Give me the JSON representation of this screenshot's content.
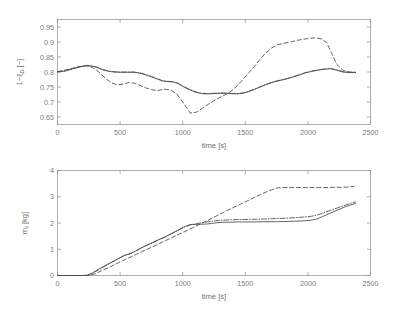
{
  "figure": {
    "background_color": "#ffffff",
    "line_color": "#4a4a4a",
    "axis_color": "#8c8c8c",
    "text_color": "#7a7a7a"
  },
  "chart_data": [
    {
      "type": "line",
      "panel": "top",
      "title": "",
      "xlabel": "time [s]",
      "ylabel": "1-ξ_D [-]",
      "ylabel_display": "1−ξ",
      "ylabel_sub": "D",
      "ylabel_unit": " [−]",
      "xlim": [
        0,
        2500
      ],
      "ylim": [
        0.625,
        0.975
      ],
      "xticks": [
        0,
        500,
        1000,
        1500,
        2000,
        2500
      ],
      "xtick_labels": [
        "0",
        "500",
        "1000",
        "1500",
        "2000",
        "2500"
      ],
      "yticks": [
        0.65,
        0.7,
        0.75,
        0.8,
        0.85,
        0.9,
        0.95
      ],
      "ytick_labels": [
        "0.65",
        "0.7",
        "0.75",
        "0.8",
        "0.85",
        "0.9",
        "0.95"
      ],
      "grid": false,
      "legend": "none",
      "series": [
        {
          "name": "solid",
          "style": "solid",
          "x": [
            0,
            60,
            120,
            180,
            230,
            270,
            310,
            350,
            400,
            450,
            500,
            560,
            610,
            660,
            700,
            750,
            800,
            840,
            880,
            920,
            960,
            1000,
            1050,
            1100,
            1150,
            1200,
            1250,
            1300,
            1340,
            1380,
            1430,
            1480,
            1530,
            1580,
            1630,
            1680,
            1730,
            1780,
            1830,
            1880,
            1930,
            1980,
            2030,
            2080,
            2130,
            2180,
            2230,
            2280,
            2330,
            2380
          ],
          "y": [
            0.8,
            0.803,
            0.81,
            0.817,
            0.821,
            0.82,
            0.816,
            0.809,
            0.803,
            0.8,
            0.799,
            0.799,
            0.799,
            0.796,
            0.791,
            0.784,
            0.776,
            0.77,
            0.768,
            0.767,
            0.762,
            0.752,
            0.742,
            0.733,
            0.728,
            0.727,
            0.728,
            0.729,
            0.729,
            0.728,
            0.727,
            0.729,
            0.735,
            0.743,
            0.752,
            0.76,
            0.767,
            0.772,
            0.777,
            0.783,
            0.79,
            0.797,
            0.802,
            0.806,
            0.809,
            0.811,
            0.806,
            0.8,
            0.798,
            0.798
          ]
        },
        {
          "name": "dash-dot",
          "style": "dashdot",
          "x": [
            0,
            60,
            120,
            180,
            230,
            270,
            310,
            350,
            400,
            450,
            500,
            560,
            610,
            660,
            700,
            750,
            800,
            840,
            880,
            920,
            960,
            1000,
            1050,
            1100,
            1150,
            1200,
            1250,
            1300,
            1340,
            1380,
            1430,
            1480,
            1530,
            1580,
            1630,
            1680,
            1730,
            1780,
            1830,
            1880,
            1930,
            1980,
            2030,
            2080,
            2130,
            2180,
            2230,
            2280,
            2330,
            2380
          ],
          "y": [
            0.801,
            0.804,
            0.811,
            0.818,
            0.822,
            0.821,
            0.817,
            0.81,
            0.804,
            0.801,
            0.8,
            0.8,
            0.8,
            0.797,
            0.792,
            0.785,
            0.777,
            0.771,
            0.769,
            0.768,
            0.763,
            0.753,
            0.743,
            0.734,
            0.729,
            0.728,
            0.729,
            0.73,
            0.73,
            0.729,
            0.728,
            0.73,
            0.736,
            0.744,
            0.753,
            0.761,
            0.768,
            0.773,
            0.778,
            0.784,
            0.791,
            0.798,
            0.803,
            0.807,
            0.81,
            0.812,
            0.807,
            0.801,
            0.799,
            0.799
          ]
        },
        {
          "name": "dashed",
          "style": "dashed",
          "x": [
            0,
            80,
            160,
            230,
            280,
            330,
            380,
            430,
            480,
            530,
            570,
            610,
            650,
            700,
            750,
            800,
            850,
            900,
            950,
            1000,
            1060,
            1110,
            1160,
            1210,
            1260,
            1310,
            1360,
            1410,
            1460,
            1510,
            1560,
            1610,
            1660,
            1710,
            1760,
            1810,
            1860,
            1910,
            1960,
            2010,
            2060,
            2110,
            2150,
            2190,
            2230,
            2280,
            2330,
            2380
          ],
          "y": [
            0.801,
            0.808,
            0.817,
            0.821,
            0.815,
            0.8,
            0.78,
            0.764,
            0.757,
            0.76,
            0.765,
            0.763,
            0.757,
            0.748,
            0.741,
            0.738,
            0.743,
            0.74,
            0.728,
            0.7,
            0.663,
            0.666,
            0.68,
            0.694,
            0.707,
            0.718,
            0.728,
            0.744,
            0.765,
            0.789,
            0.812,
            0.838,
            0.862,
            0.88,
            0.891,
            0.896,
            0.9,
            0.905,
            0.909,
            0.912,
            0.914,
            0.91,
            0.898,
            0.862,
            0.826,
            0.806,
            0.8,
            0.799
          ]
        }
      ]
    },
    {
      "type": "line",
      "panel": "bottom",
      "title": "",
      "xlabel": "time [s]",
      "ylabel": "m_f [kg]",
      "ylabel_display": "m",
      "ylabel_sub": "f",
      "ylabel_unit": " [kg]",
      "xlim": [
        0,
        2500
      ],
      "ylim": [
        0,
        4
      ],
      "xticks": [
        0,
        500,
        1000,
        1500,
        2000,
        2500
      ],
      "xtick_labels": [
        "0",
        "500",
        "1000",
        "1500",
        "2000",
        "2500"
      ],
      "yticks": [
        0,
        1,
        2,
        3,
        4
      ],
      "ytick_labels": [
        "0",
        "1",
        "2",
        "3",
        "4"
      ],
      "grid": false,
      "legend": "none",
      "series": [
        {
          "name": "solid",
          "style": "solid",
          "x": [
            0,
            120,
            200,
            240,
            280,
            330,
            380,
            430,
            480,
            530,
            570,
            610,
            660,
            710,
            760,
            810,
            860,
            910,
            960,
            1010,
            1060,
            1100,
            1140,
            1190,
            1240,
            1290,
            1330,
            1380,
            1450,
            1550,
            1650,
            1750,
            1850,
            1950,
            2020,
            2070,
            2120,
            2180,
            2240,
            2300,
            2360,
            2380
          ],
          "y": [
            0.0,
            0.0,
            0.0,
            0.01,
            0.1,
            0.24,
            0.38,
            0.5,
            0.63,
            0.76,
            0.82,
            0.9,
            1.03,
            1.15,
            1.26,
            1.37,
            1.47,
            1.6,
            1.72,
            1.85,
            1.94,
            1.95,
            1.95,
            1.96,
            1.99,
            2.02,
            2.03,
            2.03,
            2.04,
            2.04,
            2.05,
            2.05,
            2.06,
            2.08,
            2.1,
            2.15,
            2.25,
            2.38,
            2.5,
            2.62,
            2.72,
            2.74
          ]
        },
        {
          "name": "dash-dot",
          "style": "dashdot",
          "x": [
            0,
            120,
            200,
            240,
            280,
            330,
            380,
            430,
            480,
            530,
            570,
            610,
            660,
            710,
            760,
            810,
            860,
            910,
            960,
            1010,
            1060,
            1100,
            1140,
            1190,
            1240,
            1290,
            1330,
            1380,
            1450,
            1550,
            1650,
            1750,
            1850,
            1950,
            2020,
            2070,
            2120,
            2180,
            2240,
            2300,
            2360,
            2380
          ],
          "y": [
            0.0,
            0.0,
            0.0,
            0.01,
            0.09,
            0.22,
            0.36,
            0.49,
            0.62,
            0.75,
            0.81,
            0.89,
            1.02,
            1.14,
            1.25,
            1.36,
            1.46,
            1.59,
            1.71,
            1.84,
            1.93,
            1.96,
            2.0,
            2.04,
            2.07,
            2.1,
            2.11,
            2.12,
            2.13,
            2.14,
            2.15,
            2.17,
            2.19,
            2.22,
            2.25,
            2.3,
            2.38,
            2.48,
            2.58,
            2.68,
            2.78,
            2.8
          ]
        },
        {
          "name": "dashed",
          "style": "dashed",
          "x": [
            0,
            120,
            200,
            250,
            300,
            360,
            420,
            480,
            540,
            600,
            660,
            720,
            780,
            840,
            900,
            960,
            1020,
            1080,
            1140,
            1200,
            1270,
            1340,
            1410,
            1480,
            1550,
            1620,
            1690,
            1760,
            1800,
            1860,
            1920,
            1990,
            2060,
            2130,
            2200,
            2270,
            2330,
            2370
          ],
          "y": [
            0.0,
            0.0,
            0.0,
            0.0,
            0.06,
            0.2,
            0.33,
            0.47,
            0.61,
            0.74,
            0.88,
            1.01,
            1.14,
            1.28,
            1.41,
            1.55,
            1.68,
            1.82,
            1.96,
            2.1,
            2.27,
            2.44,
            2.6,
            2.76,
            2.92,
            3.08,
            3.23,
            3.34,
            3.35,
            3.35,
            3.35,
            3.35,
            3.35,
            3.35,
            3.36,
            3.36,
            3.37,
            3.4
          ]
        }
      ]
    }
  ]
}
